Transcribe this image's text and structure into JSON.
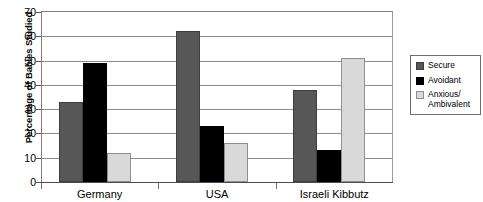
{
  "chart_data": {
    "type": "bar",
    "title": "",
    "xlabel": "",
    "ylabel": "Percentage of Babies Studied",
    "categories": [
      "Germany",
      "USA",
      "Israeli Kibbutz"
    ],
    "series": [
      {
        "name": "Secure",
        "color": "#575757",
        "values": [
          33,
          62,
          38
        ]
      },
      {
        "name": "Avoidant",
        "color": "#000000",
        "values": [
          49,
          23,
          13
        ]
      },
      {
        "name": "Anxious/\nAmbivalent",
        "color": "#d9d9d9",
        "values": [
          12,
          16,
          51
        ]
      }
    ],
    "ylim": [
      0,
      70
    ],
    "yticks": [
      0,
      10,
      20,
      30,
      40,
      50,
      60,
      70
    ],
    "ytick_labels": [
      "0",
      "10",
      "20",
      "30",
      "40",
      "50",
      "60",
      "70"
    ],
    "grid": true,
    "legend_position": "right"
  },
  "legend": {
    "entries": [
      {
        "label": "Secure"
      },
      {
        "label": "Avoidant"
      },
      {
        "label": "Anxious/\nAmbivalent"
      }
    ]
  }
}
